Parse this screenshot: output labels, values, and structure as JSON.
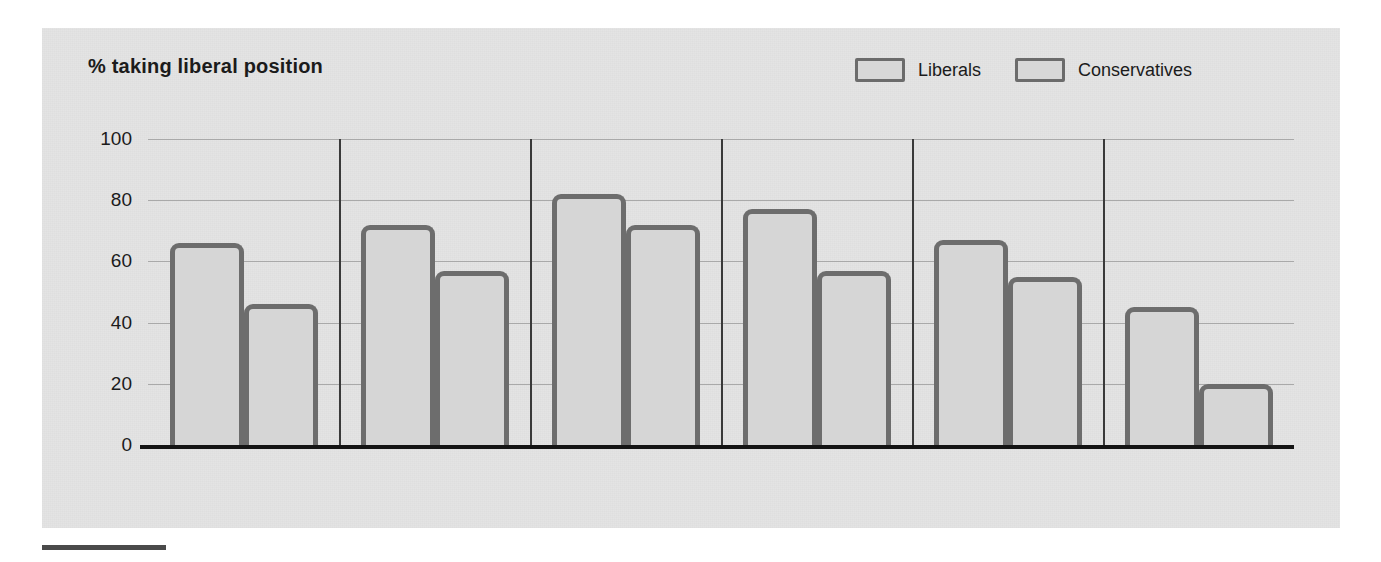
{
  "figure": {
    "title": "% taking liberal position",
    "page_mark": ""
  },
  "legend": {
    "items": [
      {
        "label": "Liberals",
        "color": "#d7d7d7",
        "border": "#6b6b6b"
      },
      {
        "label": "Conservatives",
        "color": "#d7d7d7",
        "border": "#6b6b6b"
      }
    ]
  },
  "axis": {
    "yticks": [
      "0",
      "20",
      "40",
      "60",
      "80",
      "100"
    ]
  },
  "categories": [
    "Spend on\npoor",
    "Spend on\nhealth care",
    "Spend on\neducation",
    "Spend on\nenvironment",
    "Spend to combat\ndrug addiction",
    "Spend on aid\nto blacks"
  ],
  "chart_data": {
    "type": "bar",
    "title": "% taking liberal position",
    "xlabel": "",
    "ylabel": "% taking liberal position",
    "ylim": [
      0,
      100
    ],
    "yticks": [
      0,
      20,
      40,
      60,
      80,
      100
    ],
    "grid": true,
    "legend_position": "top-right",
    "categories": [
      "Spend on poor",
      "Spend on health care",
      "Spend on education",
      "Spend on environment",
      "Spend to combat drug addiction",
      "Spend on aid to blacks"
    ],
    "series": [
      {
        "name": "Liberals",
        "values": [
          66,
          72,
          82,
          77,
          67,
          45
        ]
      },
      {
        "name": "Conservatives",
        "values": [
          46,
          57,
          72,
          57,
          55,
          20
        ]
      }
    ]
  },
  "colors": {
    "bar_fill": "#d6d6d6",
    "bar_border": "#6d6d6d",
    "panel_bg": "#e4e4e4",
    "axis": "#141414",
    "grid": "#a9a9a9",
    "separator": "#3a3a3a",
    "text": "#1b1b1b"
  }
}
